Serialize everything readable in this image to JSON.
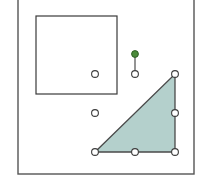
{
  "diagram": {
    "shapes": [
      {
        "id": "square",
        "kind": "rectangle",
        "selected": false
      },
      {
        "id": "triangle",
        "kind": "right-triangle",
        "selected": true
      }
    ],
    "colors": {
      "triangle_fill": "#b4d0cc",
      "rotation_handle": "#4a8a3a",
      "outline": "#3a3a3a",
      "handle_fill": "#ffffff"
    },
    "selection": {
      "target": "triangle",
      "resize_handle_count": 8,
      "rotation_handle": true
    }
  }
}
